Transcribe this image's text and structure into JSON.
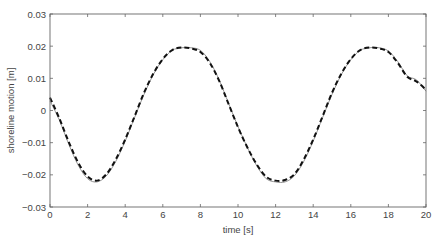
{
  "chart_data": {
    "type": "line",
    "title": "",
    "xlabel": "time [s]",
    "ylabel": "shoreline motion [m]",
    "xlim": [
      0,
      20
    ],
    "ylim": [
      -0.03,
      0.03
    ],
    "xticks": [
      0,
      2,
      4,
      6,
      8,
      10,
      12,
      14,
      16,
      18,
      20
    ],
    "xtick_labels": [
      "0",
      "2",
      "4",
      "6",
      "8",
      "10",
      "12",
      "14",
      "16",
      "18",
      "20"
    ],
    "yticks": [
      -0.03,
      -0.02,
      -0.01,
      0,
      0.01,
      0.02,
      0.03
    ],
    "ytick_labels": [
      "-0.03",
      "-0.02",
      "-0.01",
      "0",
      "0.01",
      "0.02",
      "0.03"
    ],
    "grid": false,
    "legend": null,
    "series": [
      {
        "name": "solid",
        "style": "solid",
        "color": "#888888",
        "x": [
          0,
          0.5,
          1,
          1.5,
          2,
          2.5,
          3,
          3.5,
          4,
          4.5,
          5,
          5.5,
          6,
          6.5,
          7,
          7.5,
          8,
          8.5,
          9,
          9.5,
          10,
          10.5,
          11,
          11.5,
          12,
          12.5,
          13,
          13.5,
          14,
          14.5,
          15,
          15.5,
          16,
          16.5,
          17,
          17.5,
          18,
          18.5,
          19,
          19.5,
          20
        ],
        "y": [
          0.003,
          -0.003,
          -0.0105,
          -0.017,
          -0.0212,
          -0.0222,
          -0.0203,
          -0.0158,
          -0.0095,
          -0.0022,
          0.005,
          0.0112,
          0.0158,
          0.0187,
          0.0195,
          0.0195,
          0.0187,
          0.0152,
          0.0095,
          0.0022,
          -0.005,
          -0.0115,
          -0.0172,
          -0.0212,
          -0.0222,
          -0.0222,
          -0.0203,
          -0.0158,
          -0.0095,
          -0.0022,
          0.005,
          0.0112,
          0.0158,
          0.0187,
          0.0195,
          0.0195,
          0.0185,
          0.0152,
          0.0108,
          0.0095,
          0.006
        ]
      },
      {
        "name": "dashed",
        "style": "dashed",
        "color": "#111111",
        "x": [
          0,
          0.5,
          1,
          1.5,
          2,
          2.5,
          3,
          3.5,
          4,
          4.5,
          5,
          5.5,
          6,
          6.5,
          7,
          7.5,
          8,
          8.5,
          9,
          9.5,
          10,
          10.5,
          11,
          11.5,
          12,
          12.5,
          13,
          13.5,
          14,
          14.5,
          15,
          15.5,
          16,
          16.5,
          17,
          17.5,
          18,
          18.5,
          19,
          19.5,
          20
        ],
        "y": [
          0.004,
          -0.0025,
          -0.0098,
          -0.0162,
          -0.0205,
          -0.0218,
          -0.0198,
          -0.0152,
          -0.009,
          -0.0018,
          0.0055,
          0.0115,
          0.016,
          0.0188,
          0.0196,
          0.0193,
          0.0182,
          0.0148,
          0.0092,
          0.002,
          -0.0052,
          -0.0115,
          -0.0168,
          -0.0206,
          -0.0218,
          -0.0216,
          -0.0198,
          -0.0152,
          -0.009,
          -0.0018,
          0.0055,
          0.0115,
          0.016,
          0.0188,
          0.0196,
          0.0193,
          0.0182,
          0.0148,
          0.0105,
          0.009,
          0.0065
        ]
      }
    ]
  }
}
